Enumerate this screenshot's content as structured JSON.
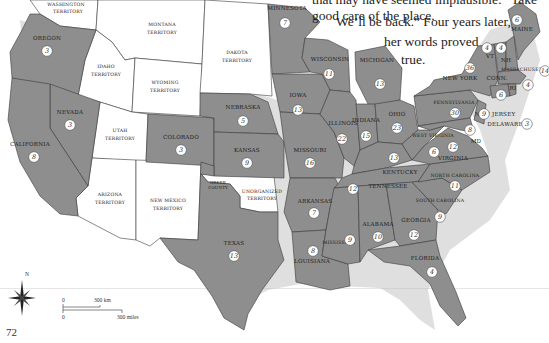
{
  "quote": {
    "line0": "that may have seemed implausible: “Take good care of the place.",
    "line1": "We’ll be back.” Four years later,",
    "line2": "her words proved",
    "line3": "true."
  },
  "page_number": "72",
  "colors": {
    "state_fill": "#8e8e8e",
    "territory_fill": "#ffffff",
    "border": "#3a3a3a",
    "coast_halo": "#b9b9b9"
  },
  "states": [
    {
      "name": "OREGON",
      "electoral_votes": 3
    },
    {
      "name": "NEVADA",
      "electoral_votes": 3
    },
    {
      "name": "CALIFORNIA",
      "electoral_votes": 8
    },
    {
      "name": "COLORADO",
      "electoral_votes": 3
    },
    {
      "name": "NEBRASKA",
      "electoral_votes": 5
    },
    {
      "name": "KANSAS",
      "electoral_votes": 9
    },
    {
      "name": "TEXAS",
      "electoral_votes": 13
    },
    {
      "name": "MINNESOTA",
      "electoral_votes": 7
    },
    {
      "name": "IOWA",
      "electoral_votes": 13
    },
    {
      "name": "MISSOURI",
      "electoral_votes": 16
    },
    {
      "name": "ARKANSAS",
      "electoral_votes": 7
    },
    {
      "name": "LOUISIANA",
      "electoral_votes": 8
    },
    {
      "name": "WISCONSIN",
      "electoral_votes": 11
    },
    {
      "name": "ILLINOIS",
      "electoral_votes": 22
    },
    {
      "name": "MICHIGAN",
      "electoral_votes": 13
    },
    {
      "name": "INDIANA",
      "electoral_votes": 15
    },
    {
      "name": "OHIO",
      "electoral_votes": 23
    },
    {
      "name": "KENTUCKY",
      "electoral_votes": 13
    },
    {
      "name": "TENNESSEE",
      "electoral_votes": 12
    },
    {
      "name": "MISSISSIPPI",
      "electoral_votes": 9
    },
    {
      "name": "ALABAMA",
      "electoral_votes": 10
    },
    {
      "name": "GEORGIA",
      "electoral_votes": 12
    },
    {
      "name": "FLORIDA",
      "electoral_votes": 4
    },
    {
      "name": "SOUTH CAROLINA",
      "electoral_votes": 9
    },
    {
      "name": "NORTH CAROLINA",
      "electoral_votes": 11
    },
    {
      "name": "VIRGINIA",
      "electoral_votes": 12
    },
    {
      "name": "WEST VIRGINIA",
      "electoral_votes": 6
    },
    {
      "name": "PENNSYLVANIA",
      "electoral_votes": 30
    },
    {
      "name": "NEW YORK",
      "electoral_votes": 36
    },
    {
      "name": "NEW JERSEY",
      "electoral_votes": 9
    },
    {
      "name": "DELAWARE",
      "electoral_votes": 3
    },
    {
      "name": "MD",
      "electoral_votes": 8
    },
    {
      "name": "VT",
      "electoral_votes": 4
    },
    {
      "name": "NH",
      "electoral_votes": 4
    },
    {
      "name": "MAINE",
      "electoral_votes": 6
    },
    {
      "name": "MASSACHUSETTS",
      "electoral_votes": 14
    },
    {
      "name": "CONN.",
      "electoral_votes": 6
    },
    {
      "name": "RI",
      "electoral_votes": 4
    }
  ],
  "territories": [
    {
      "name": "WASHINGTON TERRITORY"
    },
    {
      "name": "MONTANA TERRITORY"
    },
    {
      "name": "DAKOTA TERRITORY"
    },
    {
      "name": "IDAHO TERRITORY"
    },
    {
      "name": "WYOMING TERRITORY"
    },
    {
      "name": "UTAH TERRITORY"
    },
    {
      "name": "ARIZONA TERRITORY"
    },
    {
      "name": "NEW MEXICO TERRITORY"
    },
    {
      "name": "UNORGANIZED TERRITORY"
    }
  ],
  "annotations": {
    "greer_county": "GREER COUNTY"
  },
  "compass": {
    "north_label": "N"
  },
  "scale_bar": {
    "km_zero": "0",
    "km_label": "300 km",
    "mi_zero": "0",
    "mi_label": "300 miles"
  }
}
